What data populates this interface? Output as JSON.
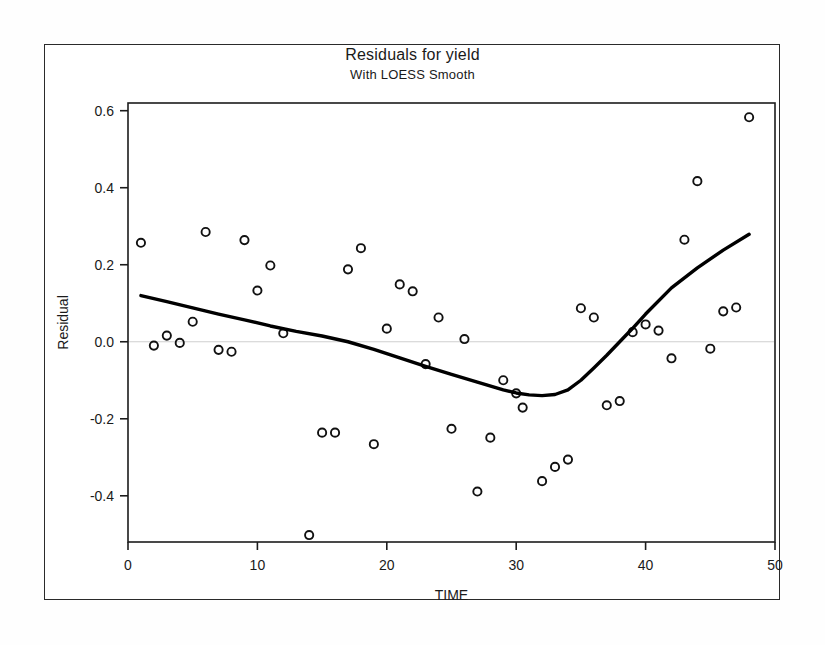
{
  "chart_data": {
    "type": "scatter",
    "title": "Residuals for yield",
    "subtitle": "With LOESS Smooth",
    "xlabel": "TIME",
    "ylabel": "Residual",
    "xlim": [
      0,
      50
    ],
    "ylim": [
      -0.52,
      0.62
    ],
    "xticks": [
      0,
      10,
      20,
      30,
      40,
      50
    ],
    "xtick_labels": [
      "0",
      "10",
      "20",
      "30",
      "40",
      "50"
    ],
    "yticks": [
      0.6,
      0.4,
      0.2,
      0.0,
      -0.2,
      -0.4
    ],
    "ytick_labels": [
      "0.6",
      "0.4",
      "0.2",
      "0.0",
      "-0.2",
      "-0.4"
    ],
    "grid": false,
    "zero_reference_line": 0.0,
    "marker": "open-circle",
    "marker_color": "#111111",
    "line_color": "#000000",
    "legend": null,
    "series": [
      {
        "name": "Residual",
        "type": "scatter",
        "x": [
          1,
          2,
          3,
          4,
          5,
          6,
          7,
          8,
          9,
          10,
          11,
          12,
          14,
          15,
          16,
          17,
          18,
          19,
          20,
          21,
          22,
          23,
          24,
          25,
          26,
          27,
          28,
          29,
          30,
          30.5,
          32,
          33,
          34,
          35,
          36,
          37,
          38,
          39,
          40,
          41,
          42,
          43,
          44,
          45,
          46,
          47,
          48
        ],
        "y": [
          0.257,
          -0.01,
          0.016,
          -0.003,
          0.052,
          0.285,
          -0.021,
          -0.026,
          0.264,
          0.133,
          0.198,
          0.022,
          -0.502,
          -0.236,
          -0.236,
          0.188,
          0.243,
          -0.266,
          0.034,
          0.149,
          0.131,
          -0.058,
          0.063,
          -0.226,
          0.007,
          -0.389,
          -0.249,
          -0.1,
          -0.134,
          -0.171,
          -0.362,
          -0.325,
          -0.306,
          0.087,
          0.063,
          -0.165,
          -0.154,
          0.025,
          0.045,
          0.029,
          -0.043,
          0.265,
          0.417,
          -0.018,
          0.079,
          0.089,
          0.583
        ]
      },
      {
        "name": "LOESS Smooth",
        "type": "line",
        "x": [
          1,
          3,
          5,
          7,
          9,
          11,
          13,
          15,
          17,
          19,
          21,
          23,
          25,
          27,
          29,
          30,
          31,
          32,
          33,
          34,
          35,
          36,
          37,
          38,
          39,
          40,
          42,
          44,
          46,
          48
        ],
        "y": [
          0.12,
          0.104,
          0.088,
          0.072,
          0.057,
          0.041,
          0.027,
          0.015,
          0.0,
          -0.02,
          -0.042,
          -0.064,
          -0.085,
          -0.105,
          -0.125,
          -0.133,
          -0.138,
          -0.14,
          -0.137,
          -0.125,
          -0.1,
          -0.068,
          -0.035,
          0.0,
          0.035,
          0.072,
          0.14,
          0.192,
          0.238,
          0.279
        ]
      }
    ]
  }
}
